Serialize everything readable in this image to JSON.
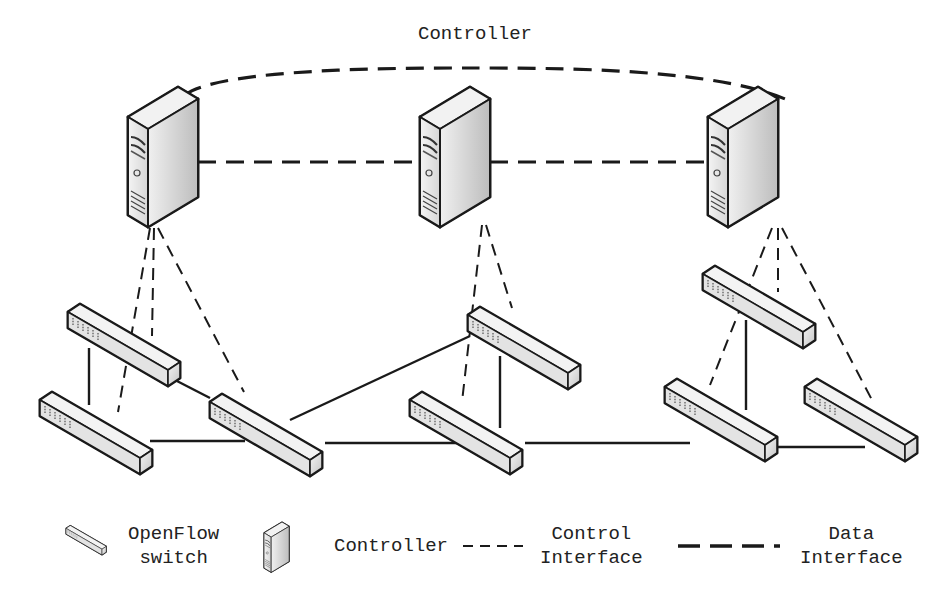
{
  "title": "Controller",
  "controllers": [
    {
      "id": "c1",
      "x": 130,
      "y": 85
    },
    {
      "id": "c2",
      "x": 420,
      "y": 85
    },
    {
      "id": "c3",
      "x": 710,
      "y": 85
    }
  ],
  "switches": [
    {
      "id": "s1",
      "x": 68,
      "y": 300
    },
    {
      "id": "s2",
      "x": 40,
      "y": 388
    },
    {
      "id": "s3",
      "x": 210,
      "y": 390
    },
    {
      "id": "s4",
      "x": 468,
      "y": 303
    },
    {
      "id": "s5",
      "x": 410,
      "y": 388
    },
    {
      "id": "s6",
      "x": 703,
      "y": 262
    },
    {
      "id": "s7",
      "x": 665,
      "y": 375
    },
    {
      "id": "s8",
      "x": 805,
      "y": 375
    }
  ],
  "legend": {
    "switch_label_line1": "OpenFlow",
    "switch_label_line2": "switch",
    "controller_label": "Controller",
    "control_label_line1": "Control",
    "control_label_line2": "Interface",
    "data_label_line1": "Data",
    "data_label_line2": "Interface"
  },
  "colors": {
    "line": "#1a1a1a",
    "device_fill": "#e8e8e8",
    "device_shade": "#c8c8c8"
  }
}
